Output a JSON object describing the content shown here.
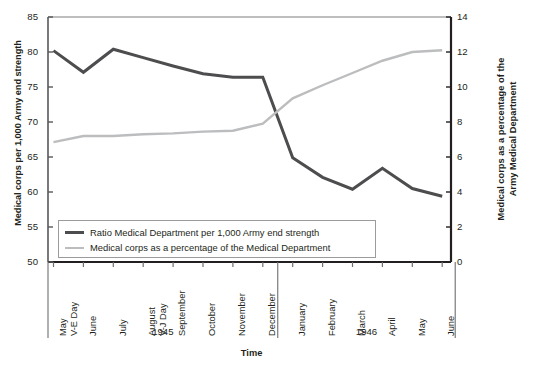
{
  "chart_data": {
    "type": "line",
    "title": "",
    "xlabel": "Time",
    "ylabel_left": "Medical corps per 1,000 Army end strength",
    "ylabel_right_line1": "Medical corps as a percentage of the",
    "ylabel_right_line2": "Army Medical Department",
    "grid": false,
    "legend_position": "bottom-left-inside",
    "ylim_left": [
      50,
      85
    ],
    "ylim_right": [
      0,
      14
    ],
    "yticks_left": [
      "50",
      "55",
      "60",
      "65",
      "70",
      "75",
      "80",
      "85"
    ],
    "yticks_right": [
      "0",
      "2",
      "4",
      "6",
      "8",
      "10",
      "12",
      "14"
    ],
    "categories": [
      "May",
      "June",
      "July",
      "August",
      "September",
      "October",
      "November",
      "December",
      "January",
      "February",
      "March",
      "April",
      "May",
      "June"
    ],
    "category_sublabels": [
      "V-E Day",
      "",
      "",
      "V-J Day",
      "",
      "",
      "",
      "",
      "",
      "",
      "",
      "",
      "",
      ""
    ],
    "year_groups": [
      {
        "label": "1945",
        "start_index": 0,
        "end_index": 7
      },
      {
        "label": "1946",
        "start_index": 8,
        "end_index": 13
      }
    ],
    "series": [
      {
        "name": "Ratio Medical Department per 1,000 Army end strength",
        "axis": "left",
        "color": "#4d4d4f",
        "width": 3.0,
        "values": [
          80.2,
          77.1,
          80.4,
          79.2,
          78.0,
          76.9,
          76.4,
          76.4,
          64.9,
          62.1,
          60.4,
          63.4,
          60.5,
          59.4
        ]
      },
      {
        "name": "Medical corps as a percentage of the Medical Department",
        "axis": "right",
        "color": "#bcbdbf",
        "width": 2.4,
        "values": [
          6.85,
          7.2,
          7.2,
          7.3,
          7.35,
          7.45,
          7.5,
          7.9,
          9.35,
          10.1,
          10.8,
          11.5,
          12.0,
          12.1
        ]
      }
    ]
  },
  "legend": {
    "entries": [
      "Ratio Medical Department per 1,000 Army end strength",
      "Medical corps as a percentage of the Medical Department"
    ]
  },
  "colors": {
    "dark_series": "#4d4d4f",
    "light_series": "#bcbdbf",
    "axis": "#231f20",
    "text": "#231f20",
    "legend_border": "#9b9b9b"
  }
}
